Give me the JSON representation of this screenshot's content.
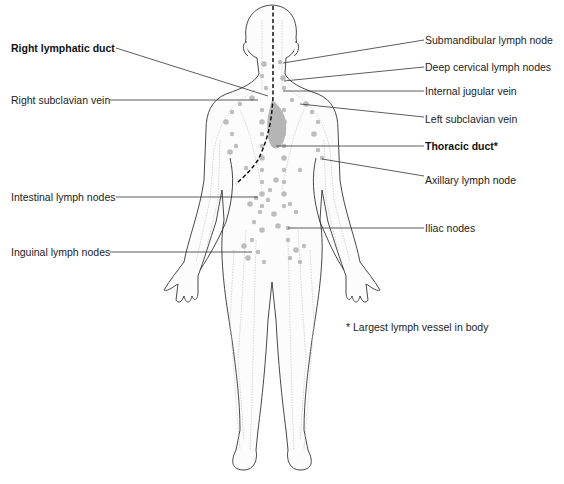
{
  "figure": {
    "footnote": "* Largest lymph vessel in body"
  },
  "labels": {
    "left": [
      {
        "id": "right-lymphatic-duct",
        "text": "Right lymphatic duct",
        "bold": true
      },
      {
        "id": "right-subclavian-vein",
        "text": "Right subclavian vein",
        "bold": false
      },
      {
        "id": "intestinal-lymph-nodes",
        "text": "Intestinal lymph nodes",
        "bold": false
      },
      {
        "id": "inguinal-lymph-nodes",
        "text": "Inguinal lymph nodes",
        "bold": false
      }
    ],
    "right": [
      {
        "id": "submandibular-lymph-node",
        "text": "Submandibular lymph node",
        "bold": false
      },
      {
        "id": "deep-cervical-lymph-nodes",
        "text": "Deep cervical lymph nodes",
        "bold": false
      },
      {
        "id": "internal-jugular-vein",
        "text": "Internal jugular vein",
        "bold": false
      },
      {
        "id": "left-subclavian-vein",
        "text": "Left subclavian vein",
        "bold": false
      },
      {
        "id": "thoracic-duct",
        "text": "Thoracic duct*",
        "bold": true
      },
      {
        "id": "axillary-lymph-node",
        "text": "Axillary lymph node",
        "bold": false
      },
      {
        "id": "iliac-nodes",
        "text": "Iliac nodes",
        "bold": false
      }
    ]
  },
  "colors": {
    "outline": "#333333",
    "node": "#bdbdbd",
    "duct": "#111111"
  }
}
